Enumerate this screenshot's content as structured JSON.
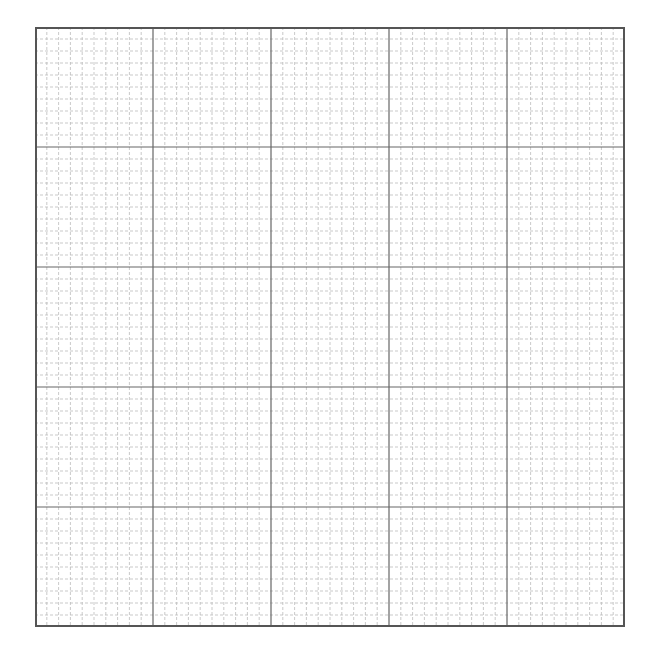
{
  "grid": {
    "major_cols": 5,
    "major_rows": 5,
    "minor_per_major": 10,
    "colors": {
      "border": "#555555",
      "major": "#666666",
      "minor": "#bbbbbb",
      "background": "#ffffff"
    }
  }
}
